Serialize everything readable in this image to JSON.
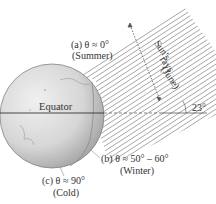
{
  "diagram": {
    "equator_label": "Equator",
    "angle_label": "23°",
    "sun_label": {
      "line1": "Sun's",
      "line2": "rays",
      "line3": "(June)"
    },
    "labels": {
      "a": {
        "line1": "(a)  θ ≈ 0°",
        "line2": "(Summer)"
      },
      "b": {
        "line1": "(b)  θ ≈ 50° – 60°",
        "line2": "(Winter)"
      },
      "c": {
        "line1": "(c)  θ ≈ 90°",
        "line2": "(Cold)"
      }
    },
    "colors": {
      "globe_light": "#e8e8e8",
      "globe_dark": "#a8a8a8",
      "line": "#555555",
      "text": "#333333"
    }
  }
}
